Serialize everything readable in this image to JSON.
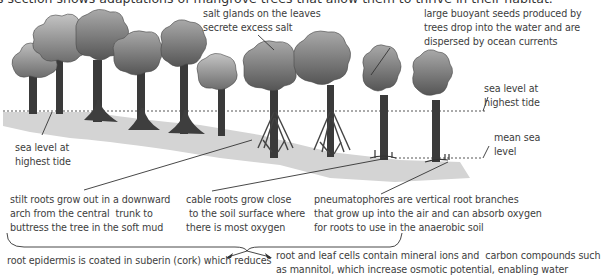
{
  "title": "This section shows adaptations of mangrove trees that allow them to thrive in their habitat.",
  "labels": {
    "salt_glands": "salt glands on the leaves\nsecrete excess salt",
    "seeds": "large buoyant seeds produced by\ntrees drop into the water and are\ndispersed by ocean currents",
    "sea_level_right": "sea level at\nhighest tide",
    "mean_sea_level": "mean sea\nlevel",
    "sea_level_left": "sea level at\nhighest tide",
    "stilt_roots": "stilt roots grow out in a downward\narch from the central  trunk to\nbuttress the tree in the soft mud",
    "cable_roots": "cable roots grow close\n to the soil surface where\nthere is most oxygen",
    "pneumatophores": "pneumatophores are vertical root branches\nthat grow up into the air and can absorb oxygen\nfor roots to use in the anaerobic soil",
    "suberin": "root epidermis is coated in suberin (cork) which reduces",
    "mineral_ions": "root and leaf cells contain mineral ions and  carbon compounds such\nas mannitol, which increase osmotic potential, enabling water"
  },
  "colors": {
    "foliage_light": "#b8b8b8",
    "foliage_dark": "#5a5a5a",
    "trunk": "#3c3c3c",
    "mud": "#d6d6d6",
    "line": "#333333"
  }
}
